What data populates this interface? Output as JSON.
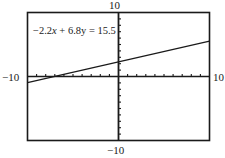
{
  "chart_data": {
    "type": "line",
    "title": "",
    "equation": "−2.2x + 6.8y = 15.5",
    "equation_parts": {
      "a": "−2.2",
      "x_var": "x",
      "op": " + ",
      "b": "6.8",
      "y_var": "y",
      "eq": " = ",
      "c": "15.5"
    },
    "xlabel": "",
    "ylabel": "",
    "xlim": [
      -10,
      10
    ],
    "ylim": [
      -10,
      10
    ],
    "x_tick_step": 1,
    "y_tick_step": 1,
    "axis_labels": {
      "xmin": "−10",
      "xmax": "10",
      "ymin": "−10",
      "ymax": "10"
    },
    "grid": false,
    "legend": null,
    "series": [
      {
        "name": "−2.2x + 6.8y = 15.5",
        "slope": 0.3235,
        "intercept": 2.2794,
        "x": [
          -10,
          10
        ],
        "y": [
          -0.96,
          5.51
        ]
      }
    ]
  },
  "colors": {
    "line": "#1a1a1a",
    "frame": "#1a1a1a",
    "axes": "#1a1a1a",
    "background": "#ffffff"
  }
}
